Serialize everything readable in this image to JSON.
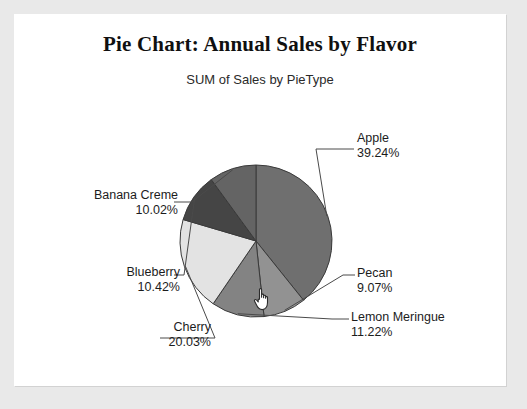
{
  "chart_data": {
    "type": "pie",
    "title": "Pie Chart: Annual Sales by Flavor",
    "subtitle": "SUM of Sales by PieType",
    "xlabel": "",
    "ylabel": "",
    "legend_position": "none",
    "grid": false,
    "labels_show_percent": true,
    "categories": [
      "Apple",
      "Pecan",
      "Lemon Meringue",
      "Cherry",
      "Blueberry",
      "Banana Creme"
    ],
    "values": [
      39.24,
      9.07,
      11.22,
      20.03,
      10.42,
      10.02
    ],
    "slices": [
      {
        "name": "Apple",
        "label": "Apple",
        "percent_text": "39.24%",
        "value": 39.24,
        "color": "#6f6f6f",
        "side": "right",
        "highlighted": false
      },
      {
        "name": "Pecan",
        "label": "Pecan",
        "percent_text": "9.07%",
        "value": 9.07,
        "color": "#929292",
        "side": "right",
        "highlighted": false
      },
      {
        "name": "Lemon Meringue",
        "label": "Lemon Meringue",
        "percent_text": "11.22%",
        "value": 11.22,
        "color": "#838383",
        "side": "right",
        "highlighted": false
      },
      {
        "name": "Cherry",
        "label": "Cherry",
        "percent_text": "20.03%",
        "value": 20.03,
        "color": "#e3e3e3",
        "side": "left",
        "highlighted": true
      },
      {
        "name": "Blueberry",
        "label": "Blueberry",
        "percent_text": "10.42%",
        "value": 10.42,
        "color": "#454545",
        "side": "left",
        "highlighted": false
      },
      {
        "name": "Banana Creme",
        "label": "Banana Creme",
        "percent_text": "10.02%",
        "value": 10.02,
        "color": "#646464",
        "side": "left",
        "highlighted": false
      }
    ]
  },
  "colors": {
    "page_background": "#e9e9e9",
    "panel_background": "#ffffff",
    "text": "#1c1c1c",
    "slice_outline": "#3a3a3a",
    "leader_line": "#4a4a4a"
  },
  "cursor": {
    "name": "hand-pointer-cursor",
    "over_slice": "Cherry",
    "x": 238,
    "y": 272
  }
}
